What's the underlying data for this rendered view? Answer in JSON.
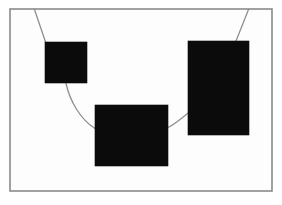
{
  "figure": {
    "background_color": "#ffffff",
    "canvas": {
      "width": 282,
      "height": 205
    }
  },
  "frame": {
    "name": "outer frame",
    "x": 10,
    "y": 9,
    "width": 262,
    "height": 182,
    "fill_color": "#fdfdfd",
    "stroke_color": "#8a8a8a",
    "stroke_width": 1.6
  },
  "shapes": [
    {
      "id": "upper-left-square",
      "label": "upper left square",
      "x": 45,
      "y": 42,
      "width": 42,
      "height": 41,
      "fill_color": "#0b0b0b"
    },
    {
      "id": "center-rectangle",
      "label": "center rectangle",
      "x": 95,
      "y": 105,
      "width": 73,
      "height": 61,
      "fill_color": "#0b0b0b"
    },
    {
      "id": "right-rectangle",
      "label": "right tall rectangle",
      "x": 188,
      "y": 41,
      "width": 61,
      "height": 94,
      "fill_color": "#0b0b0b"
    }
  ],
  "connectors": [
    {
      "id": "top-left-stem",
      "label": "line from top border to upper left square",
      "path": "M 34.5 9.5 L 45.5 42",
      "stroke_color": "#8f8f8f",
      "stroke_width": 1.3
    },
    {
      "id": "left-to-center-curve",
      "label": "curve from upper left square to center rectangle",
      "path": "M 66 83.5 C 70 101, 80 119, 95 128.5",
      "stroke_color": "#8f8f8f",
      "stroke_width": 1.3
    },
    {
      "id": "center-to-right-curve",
      "label": "curve from center rectangle to right rectangle",
      "path": "M 168 127.5 C 175 124, 182 118, 188 113",
      "stroke_color": "#8f8f8f",
      "stroke_width": 1.3
    },
    {
      "id": "top-right-stem",
      "label": "line from top border to right rectangle",
      "path": "M 248.5 9.5 L 236 41",
      "stroke_color": "#8f8f8f",
      "stroke_width": 1.3
    }
  ]
}
